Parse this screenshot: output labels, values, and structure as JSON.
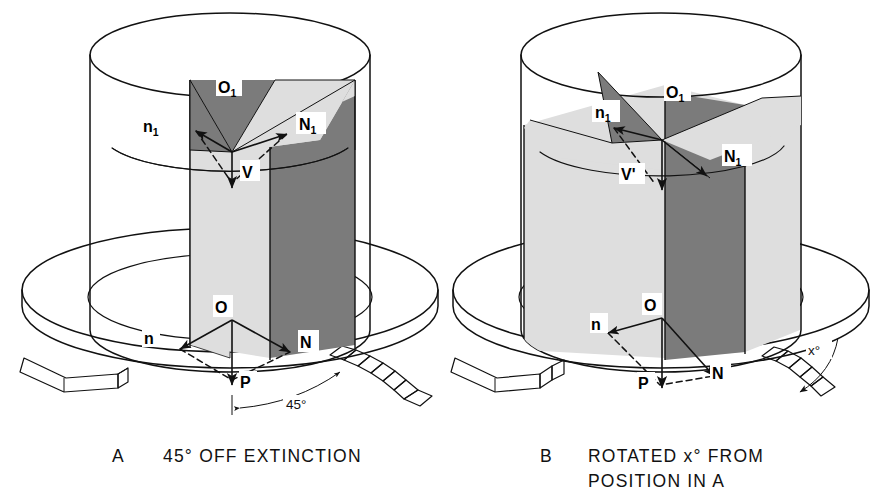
{
  "figure": {
    "background_color": "#ffffff",
    "line_color": "#111111"
  },
  "colors": {
    "dark_plane": "#7b7b7b",
    "light_plane": "#dedede",
    "mid_plane": "#c9c9c9",
    "stage_fill": "#ffffff",
    "outline": "#111111",
    "label_box": "#ffffff"
  },
  "panels": [
    {
      "id": "A",
      "letter": "A",
      "caption": "45° OFF EXTINCTION",
      "caption_lines": [
        "45° OFF EXTINCTION"
      ],
      "labels": [
        {
          "name": "label-o1",
          "text": "O",
          "sub": "1"
        },
        {
          "name": "label-n1-lower",
          "text": "n",
          "sub": "1"
        },
        {
          "name": "label-N1-upper",
          "text": "N",
          "sub": "1"
        },
        {
          "name": "label-v",
          "text": "V",
          "sub": ""
        },
        {
          "name": "label-o",
          "text": "O",
          "sub": ""
        },
        {
          "name": "label-n",
          "text": "n",
          "sub": ""
        },
        {
          "name": "label-N",
          "text": "N",
          "sub": ""
        },
        {
          "name": "label-p",
          "text": "P",
          "sub": ""
        }
      ],
      "angle_annotation": {
        "name": "angle-45",
        "text": "45°",
        "value": 45,
        "unit": "degrees"
      }
    },
    {
      "id": "B",
      "letter": "B",
      "caption": "ROTATED x° FROM POSITION IN A",
      "caption_lines": [
        "ROTATED x° FROM",
        "POSITION IN A"
      ],
      "labels": [
        {
          "name": "label-o1",
          "text": "O",
          "sub": "1"
        },
        {
          "name": "label-n1-lower",
          "text": "n",
          "sub": "1"
        },
        {
          "name": "label-N1-upper",
          "text": "N",
          "sub": "1"
        },
        {
          "name": "label-vprime",
          "text": "V'",
          "sub": ""
        },
        {
          "name": "label-o",
          "text": "O",
          "sub": ""
        },
        {
          "name": "label-n",
          "text": "n",
          "sub": ""
        },
        {
          "name": "label-N",
          "text": "N",
          "sub": ""
        },
        {
          "name": "label-p",
          "text": "P",
          "sub": ""
        }
      ],
      "angle_annotation": {
        "name": "angle-x",
        "text": "x°",
        "value": "x",
        "unit": "degrees"
      }
    }
  ],
  "caption_text": {
    "a_letter": "A",
    "a_line1": "45° OFF EXTINCTION",
    "b_letter": "B",
    "b_line1": "ROTATED x° FROM",
    "b_line2": "POSITION IN A"
  },
  "label_text": {
    "O": "O",
    "O1_base": "O",
    "O1_sub": "1",
    "n": "n",
    "n1_base": "n",
    "n1_sub": "1",
    "N": "N",
    "N1_base": "N",
    "N1_sub": "1",
    "P": "P",
    "V": "V",
    "Vprime": "V'",
    "angle45": "45°",
    "anglex": "x°"
  }
}
